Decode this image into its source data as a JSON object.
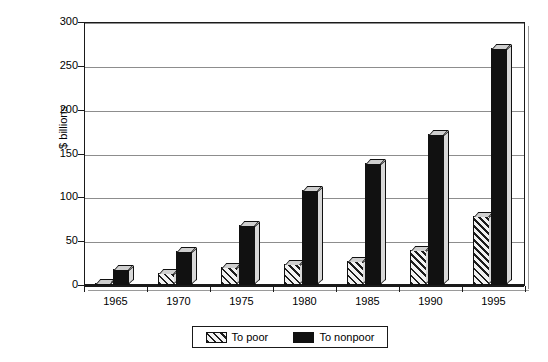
{
  "chart_data": {
    "type": "bar",
    "title": "",
    "subtitle": "",
    "xlabel": "",
    "ylabel": "$ billions",
    "categories": [
      "1965",
      "1970",
      "1975",
      "1980",
      "1985",
      "1990",
      "1995"
    ],
    "series": [
      {
        "name": "To poor",
        "values": [
          2,
          14,
          20,
          24,
          27,
          40,
          79
        ]
      },
      {
        "name": "To nonpoor",
        "values": [
          18,
          39,
          68,
          108,
          139,
          172,
          270
        ]
      }
    ],
    "ylim": [
      0,
      300
    ],
    "ytick_values": [
      0,
      50,
      100,
      150,
      200,
      250,
      300
    ],
    "ytick_labels": [
      "0",
      "50",
      "100",
      "150",
      "200",
      "250",
      "300"
    ],
    "grid": true,
    "legend_position": "bottom",
    "colors": {
      "to_poor": "#e9e9e9",
      "to_poor_hatch": "#1d1d1d",
      "to_nonpoor": "#111111",
      "gridline": "#8d8d8d",
      "axis": "#1a1a1a",
      "background": "#ffffff"
    }
  },
  "legend": {
    "items": [
      {
        "label": "To poor",
        "pattern": "diagonal-hatch"
      },
      {
        "label": "To nonpoor",
        "pattern": "solid-black"
      }
    ]
  }
}
